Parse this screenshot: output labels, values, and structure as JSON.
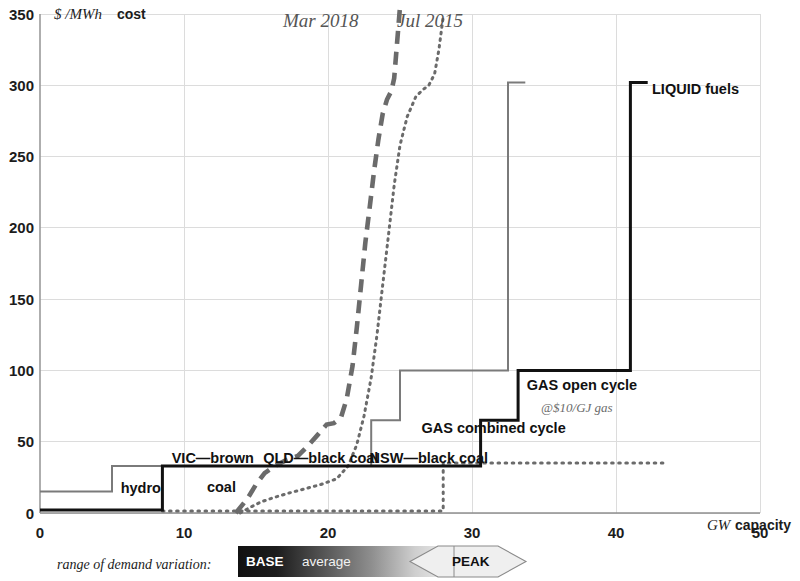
{
  "chart_data": {
    "type": "line",
    "title": "",
    "xlabel": "GW capacity",
    "ylabel": "$ /MWh cost",
    "xlim": [
      0,
      50
    ],
    "ylim": [
      0,
      350
    ],
    "xticks": [
      0,
      10,
      20,
      30,
      40,
      50
    ],
    "yticks": [
      0,
      50,
      100,
      150,
      200,
      250,
      300,
      350
    ],
    "grid": true,
    "legend_position": "top-center",
    "series": [
      {
        "name": "Mar 2018",
        "style": "dashed",
        "color": "#6b6b6b",
        "x": [
          13.6,
          14.4,
          15.0,
          15.6,
          16.3,
          17.1,
          17.9,
          18.6,
          19.3,
          19.9,
          20.4,
          20.9,
          21.3,
          21.7,
          22.0,
          22.3,
          22.6,
          22.9,
          23.2,
          23.5,
          23.8,
          24.1,
          24.4,
          24.6,
          24.8,
          25.0
        ],
        "y": [
          0,
          10,
          20,
          28,
          33,
          37,
          40,
          47,
          55,
          62,
          63,
          67,
          80,
          103,
          130,
          160,
          190,
          215,
          240,
          262,
          280,
          290,
          296,
          305,
          330,
          355
        ]
      },
      {
        "name": "Jul 2015",
        "style": "dotted",
        "color": "#6b6b6b",
        "x": [
          13.9,
          14.6,
          15.4,
          16.3,
          17.3,
          18.4,
          19.5,
          20.6,
          21.4,
          22.0,
          22.5,
          23.0,
          23.4,
          23.8,
          24.2,
          24.6,
          25.0,
          25.5,
          26.1,
          26.6,
          27.0,
          27.4,
          27.7,
          28.0
        ],
        "y": [
          0,
          4,
          8,
          11,
          14,
          17,
          20,
          24,
          33,
          48,
          68,
          95,
          125,
          160,
          195,
          230,
          258,
          278,
          292,
          297,
          300,
          308,
          325,
          348
        ]
      },
      {
        "name": "Mar 2018 demand duration",
        "style": "dotted-low",
        "color": "#6b6b6b",
        "x": [
          8.5,
          28.0,
          28.0,
          43.6
        ],
        "y": [
          1.5,
          1.5,
          35.0,
          35.0
        ]
      },
      {
        "name": "supply curve 2018",
        "style": "step-gray",
        "color": "#7a7a7a",
        "x": [
          0,
          5.0,
          5.0,
          8.3,
          8.3,
          13.9,
          13.9,
          23.0,
          23.0,
          25.0,
          25.0,
          32.5,
          32.5,
          33.7
        ],
        "y": [
          15,
          15,
          33,
          33,
          33,
          33,
          33,
          33,
          65,
          65,
          100,
          100,
          302,
          302
        ]
      },
      {
        "name": "supply curve current",
        "style": "step-black",
        "color": "#111111",
        "x": [
          0,
          8.5,
          8.5,
          13.7,
          13.7,
          21.2,
          21.2,
          30.6,
          30.6,
          33.2,
          33.2,
          41.0,
          41.0,
          42.2
        ],
        "y": [
          2,
          2,
          33,
          33,
          33,
          33,
          33,
          33,
          65,
          65,
          100,
          100,
          302,
          302
        ]
      }
    ],
    "annotations": [
      {
        "id": "hydro",
        "text": "hydro",
        "x": 7.0,
        "y": 14
      },
      {
        "id": "vic-brown-coal-1",
        "text": "VIC—brown",
        "x": 12.0,
        "y": 35
      },
      {
        "id": "vic-brown-coal-2",
        "text": "coal",
        "x": 12.6,
        "y": 15
      },
      {
        "id": "qld-black-coal",
        "text": "QLD—black coal",
        "x": 19.5,
        "y": 35
      },
      {
        "id": "nsw-black-coal",
        "text": "NSW—black coal",
        "x": 27.0,
        "y": 35
      },
      {
        "id": "gas-combined-cycle",
        "text": "GAS combined cycle",
        "x": 31.5,
        "y": 56
      },
      {
        "id": "gas-open-cycle",
        "text": "GAS open cycle",
        "x": 33.8,
        "y": 86
      },
      {
        "id": "gas-open-cycle-price",
        "text": "@$10/GJ gas",
        "x": 34.8,
        "y": 71
      },
      {
        "id": "liquid-fuels",
        "text": "LIQUID fuels",
        "x": 42.5,
        "y": 294
      }
    ]
  },
  "axes": {
    "y_unit_symbol": "$ /MWh",
    "y_unit_word": "cost",
    "x_unit_symbol": "GW",
    "x_unit_word": "capacity",
    "y_tick_labels": [
      "0",
      "50",
      "100",
      "150",
      "200",
      "250",
      "300",
      "350"
    ],
    "x_tick_labels": [
      "0",
      "10",
      "20",
      "30",
      "40",
      "50"
    ]
  },
  "series_legend": {
    "left_label": "Mar 2018",
    "right_label": "Jul 2015"
  },
  "demand_legend": {
    "caption": "range of demand variation:",
    "base_label": "BASE",
    "average_label": "average",
    "peak_label": "PEAK",
    "gradient_from": "#151515",
    "gradient_to": "#f2f2f2"
  },
  "colors": {
    "gray_series": "#7a7a7a",
    "black_series": "#111111",
    "grid": "#d9d9d9",
    "text": "#1a1a1a",
    "muted_text": "#6b6b6b"
  }
}
